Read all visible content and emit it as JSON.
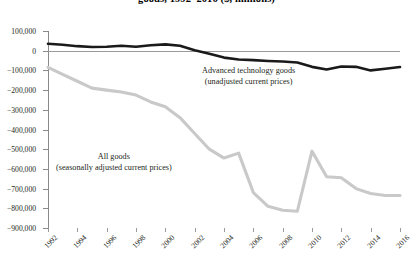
{
  "title": "goods, 1992–2016 ($, millions)",
  "annotations": {
    "advanced": {
      "line1": "Advanced technology goods",
      "line2": "(unadjusted current prices)"
    },
    "all": {
      "line1": "All goods",
      "line2": "(seasonally adjusted current prices)"
    }
  },
  "axis": {
    "y_ticklabels": [
      "100,000",
      "0",
      "−100,000",
      "−200,000",
      "−300,000",
      "−400,000",
      "−500,000",
      "−600,000",
      "−700,000",
      "−800,000",
      "−900,000"
    ],
    "x_ticklabels": [
      "1992",
      "1994",
      "1996",
      "1998",
      "2000",
      "2002",
      "2004",
      "2006",
      "2008",
      "2010",
      "2012",
      "2014",
      "2016"
    ]
  },
  "colors": {
    "advanced_line": "#1a1a1a",
    "all_line": "#c9c9c9",
    "axis": "#8a8a8a",
    "zero_line": "#9a9a9a",
    "text": "#231f20"
  },
  "chart_data": {
    "type": "line",
    "title": "goods, 1992–2016 ($, millions)",
    "xlabel": "",
    "ylabel": "",
    "ylim": [
      -900000,
      100000
    ],
    "xlim": [
      1992,
      2016
    ],
    "grid": false,
    "legend": "inline-annotations",
    "x": [
      1992,
      1993,
      1994,
      1995,
      1996,
      1997,
      1998,
      1999,
      2000,
      2001,
      2002,
      2003,
      2004,
      2005,
      2006,
      2007,
      2008,
      2009,
      2010,
      2011,
      2012,
      2013,
      2014,
      2015,
      2016
    ],
    "series": [
      {
        "name": "Advanced technology goods (unadjusted current prices)",
        "color": "#1a1a1a",
        "values": [
          35000,
          30000,
          23000,
          19000,
          20000,
          25000,
          20000,
          28000,
          32000,
          25000,
          2000,
          -15000,
          -35000,
          -45000,
          -48000,
          -52000,
          -55000,
          -60000,
          -82000,
          -95000,
          -80000,
          -82000,
          -100000,
          -92000,
          -83000
        ]
      },
      {
        "name": "All goods (seasonally adjusted current prices)",
        "color": "#c9c9c9",
        "values": [
          -85000,
          -120000,
          -155000,
          -190000,
          -200000,
          -210000,
          -225000,
          -260000,
          -285000,
          -340000,
          -420000,
          -500000,
          -545000,
          -520000,
          -720000,
          -790000,
          -810000,
          -815000,
          -510000,
          -640000,
          -645000,
          -700000,
          -725000,
          -735000,
          -735000
        ]
      }
    ]
  }
}
